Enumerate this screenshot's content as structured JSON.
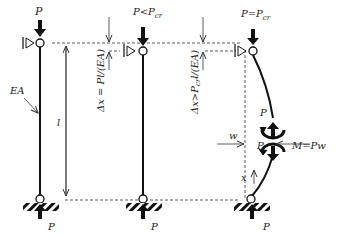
{
  "diagram": {
    "columns": [
      {
        "id": "column-1",
        "top_load_label": "P",
        "stiffness_label": "EA",
        "length_label": "l",
        "bottom_reaction_label": "P"
      },
      {
        "id": "column-2",
        "top_load_label": "P<P",
        "top_load_sub": "cr",
        "shortening_label": "Δx = Pl/(EA)",
        "bottom_reaction_label": "P"
      },
      {
        "id": "column-3",
        "top_load_label": "P=P",
        "top_load_sub": "cr",
        "shortening_label": "Δx>P",
        "shortening_sub": "cr",
        "shortening_tail": "l/(EA)",
        "moment_label": "M=Pw",
        "deflection_label": "w",
        "section_force_upper": "P",
        "section_force_lower": "P",
        "coordinate_label": "x",
        "bottom_reaction_label": "P"
      }
    ]
  }
}
